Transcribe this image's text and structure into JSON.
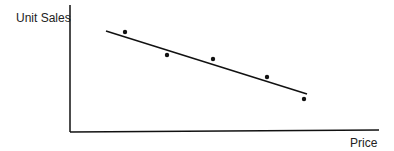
{
  "chart_data": {
    "type": "scatter",
    "title": "",
    "xlabel": "Price",
    "ylabel": "Unit Sales",
    "grid": false,
    "legend": "none",
    "note": "No tick labels or numeric scale are shown; point positions are recorded in pixel coordinates.",
    "points_px": [
      {
        "x": 125,
        "y": 32
      },
      {
        "x": 167,
        "y": 55
      },
      {
        "x": 213,
        "y": 59
      },
      {
        "x": 267,
        "y": 77
      },
      {
        "x": 304,
        "y": 99
      }
    ],
    "trendline_px": {
      "x1": 106,
      "y1": 31,
      "x2": 307,
      "y2": 94
    }
  },
  "colors": {
    "ink": "#111111"
  }
}
